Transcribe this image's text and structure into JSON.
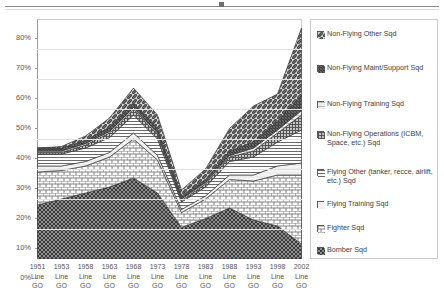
{
  "chart_data": {
    "type": "area",
    "stacked": true,
    "title": "",
    "subtitle": "",
    "xlabel": "",
    "ylabel": "",
    "ylim": [
      0,
      80
    ],
    "yticks": [
      "0%",
      "10%",
      "20%",
      "30%",
      "40%",
      "50%",
      "60%",
      "70%",
      "80%"
    ],
    "ytick_values": [
      0,
      10,
      20,
      30,
      40,
      50,
      60,
      70,
      80
    ],
    "grid": true,
    "legend_position": "right",
    "categories": [
      "1951 Line GO",
      "1953 Line GO",
      "1958 Line GO",
      "1963 Line GO",
      "1968 Line GO",
      "1973 Line GO",
      "1978 Line GO",
      "1983 Line GO",
      "1988 Line GO",
      "1993 Line GO",
      "1998 Line GO",
      "2002 Line GO"
    ],
    "category_lines": [
      [
        "1951",
        "Line",
        "GO"
      ],
      [
        "1953",
        "Line",
        "GO"
      ],
      [
        "1958",
        "Line",
        "GO"
      ],
      [
        "1963",
        "Line",
        "GO"
      ],
      [
        "1968",
        "Line",
        "GO"
      ],
      [
        "1973",
        "Line",
        "GO"
      ],
      [
        "1978",
        "Line",
        "GO"
      ],
      [
        "1983",
        "Line",
        "GO"
      ],
      [
        "1988",
        "Line",
        "GO"
      ],
      [
        "1993",
        "Line",
        "GO"
      ],
      [
        "1998",
        "Line",
        "GO"
      ],
      [
        "2002",
        "Line",
        "GO"
      ]
    ],
    "series": [
      {
        "name": "Bomber Sqd",
        "pattern": "dark-checker",
        "values": [
          18.0,
          20.0,
          22.0,
          24.0,
          27.0,
          22.0,
          10.5,
          13.5,
          17.0,
          13.0,
          11.0,
          5.0
        ]
      },
      {
        "name": "Fighter Sqd",
        "pattern": "brick",
        "values": [
          11.0,
          9.5,
          9.0,
          10.0,
          13.0,
          11.0,
          5.0,
          6.5,
          9.5,
          13.0,
          17.0,
          23.0
        ]
      },
      {
        "name": "Flying Training Sqd",
        "pattern": "light-solid",
        "values": [
          2.0,
          1.5,
          1.5,
          1.5,
          2.0,
          1.5,
          1.0,
          1.0,
          1.5,
          2.0,
          3.0,
          4.0
        ]
      },
      {
        "name": "Flying Other (tanker, recce, airlift, etc.) Sqd",
        "pattern": "horizontal-lines",
        "values": [
          4.0,
          4.0,
          4.5,
          5.0,
          6.0,
          5.5,
          2.5,
          3.0,
          4.5,
          6.0,
          8.0,
          11.0
        ]
      },
      {
        "name": "Non-Flying Operations (ICBM, Space, etc.) Sqd",
        "pattern": "fine-grid",
        "values": [
          0.5,
          0.5,
          1.0,
          1.5,
          2.0,
          1.5,
          0.5,
          1.0,
          1.5,
          2.0,
          3.0,
          5.0
        ]
      },
      {
        "name": "Non-Flying Training Sqd",
        "pattern": "pale-lines",
        "values": [
          0.5,
          0.5,
          0.5,
          0.5,
          0.5,
          0.5,
          0.5,
          0.5,
          0.5,
          1.0,
          1.0,
          1.5
        ]
      },
      {
        "name": "Non-Flying Maint/Support Sqd",
        "pattern": "dense-diag",
        "values": [
          1.0,
          1.0,
          1.0,
          1.5,
          1.5,
          1.5,
          1.0,
          1.0,
          1.5,
          2.0,
          3.0,
          5.0
        ]
      },
      {
        "name": "Non-Flying Other Sqd",
        "pattern": "diagonal-hatch",
        "values": [
          0.0,
          0.5,
          1.5,
          3.0,
          5.0,
          4.5,
          2.0,
          3.5,
          7.5,
          12.0,
          9.0,
          22.5
        ]
      }
    ],
    "totals": [
      37.0,
      37.5,
      41.0,
      47.0,
      57.0,
      48.0,
      23.0,
      30.0,
      43.5,
      51.0,
      55.0,
      77.0
    ]
  },
  "legend": {
    "items": [
      {
        "label": "Non-Flying Other Sqd",
        "pattern": "diagonal-hatch"
      },
      {
        "label": "Non-Flying Maint/Support Sqd",
        "pattern": "dense-diag"
      },
      {
        "label": "Non-Flying Training Sqd",
        "pattern": "pale-lines"
      },
      {
        "label": "Non-Flying Operations (ICBM, Space, etc.) Sqd",
        "pattern": "fine-grid"
      },
      {
        "label": "Flying Other (tanker, recce, airlift, etc.) Sqd",
        "pattern": "horizontal-lines"
      },
      {
        "label": "Flying Training Sqd",
        "pattern": "light-solid"
      },
      {
        "label": "Fighter Sqd",
        "pattern": "brick"
      },
      {
        "label": "Bomber Sqd",
        "pattern": "dark-checker"
      }
    ]
  },
  "colors": {
    "axis": "#9a9a9a",
    "grid": "#e2e2e2",
    "text": "#4a4a4a",
    "legend_border": "#c9c9c9"
  }
}
